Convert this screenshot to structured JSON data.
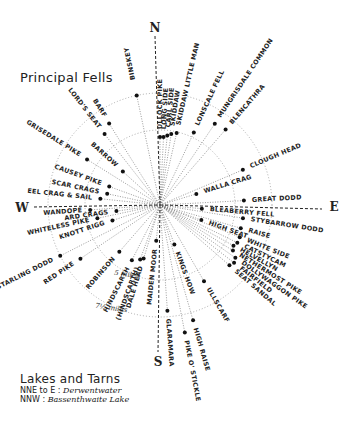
{
  "title": "Principal Fells",
  "compass": {
    "n": "N",
    "e": "E",
    "s": "S",
    "w": "W"
  },
  "center": {
    "x": 160,
    "y": 205
  },
  "rings": [
    {
      "label": "5 miles",
      "r": 75
    },
    {
      "label": "7½ miles",
      "r": 112
    }
  ],
  "fells": [
    {
      "name": "BINSKEY",
      "angle": -12,
      "dot": 112,
      "label": 128
    },
    {
      "name": "ULLOCK PIKE",
      "angle": 0,
      "dot": 68,
      "label": 76
    },
    {
      "name": "LONG SIDE",
      "angle": 3,
      "dot": 68,
      "label": 76
    },
    {
      "name": "CARL SIDE",
      "angle": 6,
      "dot": 70,
      "label": 78
    },
    {
      "name": "SKIDDAW",
      "angle": 9,
      "dot": 72,
      "label": 80
    },
    {
      "name": "SKIDDAW LITTLE MAN",
      "angle": 13,
      "dot": 74,
      "label": 82
    },
    {
      "name": "LONSCALE FELL",
      "angle": 25,
      "dot": 80,
      "label": 88
    },
    {
      "name": "MUNGRISDALE COMMON",
      "angle": 34,
      "dot": 98,
      "label": 106
    },
    {
      "name": "BLENCATHRA",
      "angle": 41,
      "dot": 100,
      "label": 108
    },
    {
      "name": "CLOUGH HEAD",
      "angle": 67,
      "dot": 90,
      "label": 98
    },
    {
      "name": "WALLA CRAG",
      "angle": 73,
      "dot": 38,
      "label": 46
    },
    {
      "name": "GREAT DODD",
      "angle": 87,
      "dot": 84,
      "label": 92
    },
    {
      "name": "BLEABERRY FELL",
      "angle": 95,
      "dot": 42,
      "label": 50
    },
    {
      "name": "STYBARROW DODD",
      "angle": 99,
      "dot": 84,
      "label": 92
    },
    {
      "name": "RAISE",
      "angle": 106,
      "dot": 84,
      "label": 92
    },
    {
      "name": "HIGH SEAT",
      "angle": 110,
      "dot": 44,
      "label": 52
    },
    {
      "name": "WHITE SIDE",
      "angle": 112,
      "dot": 86,
      "label": 94
    },
    {
      "name": "CATSTYCAM",
      "angle": 116,
      "dot": 86,
      "label": 94
    },
    {
      "name": "HELVELLYN",
      "angle": 119,
      "dot": 84,
      "label": 92
    },
    {
      "name": "NETHERMOST PIKE",
      "angle": 122,
      "dot": 86,
      "label": 94
    },
    {
      "name": "DOLLYWAGGON PIKE",
      "angle": 125,
      "dot": 92,
      "label": 100
    },
    {
      "name": "FAIRFIELD",
      "angle": 128,
      "dot": 94,
      "label": 102
    },
    {
      "name": "SEAT SANDAL",
      "angle": 131,
      "dot": 92,
      "label": 100
    },
    {
      "name": "ULLSCARF",
      "angle": 150,
      "dot": 88,
      "label": 96
    },
    {
      "name": "KINGS HOW",
      "angle": 160,
      "dot": 42,
      "label": 50
    },
    {
      "name": "HIGH RAISE",
      "angle": 164,
      "dot": 120,
      "label": 128
    },
    {
      "name": "PIKE O' STICKLE",
      "angle": 169,
      "dot": 130,
      "label": 138
    },
    {
      "name": "GLARAMARA",
      "angle": 176,
      "dot": 106,
      "label": 114
    },
    {
      "name": "MAIDEN MOOR",
      "angle": 186,
      "dot": 36,
      "label": 44
    },
    {
      "name": "DALE HEAD",
      "angle": 197,
      "dot": 56,
      "label": 64
    },
    {
      "name": "(HINDSCARTH)",
      "angle": 200,
      "dot": 58,
      "label": 66
    },
    {
      "name": "HINDSCARTH",
      "angle": 207,
      "dot": 62,
      "label": 70
    },
    {
      "name": "ROBINSON",
      "angle": 221,
      "dot": 62,
      "label": 70
    },
    {
      "name": "RED PIKE",
      "angle": 236,
      "dot": 96,
      "label": 104
    },
    {
      "name": "STARLING DODD",
      "angle": 243,
      "dot": 112,
      "label": 120
    },
    {
      "name": "KNOTT RIGG",
      "angle": 252,
      "dot": 50,
      "label": 58
    },
    {
      "name": "WHITELESS PIKE",
      "angle": 258,
      "dot": 64,
      "label": 72
    },
    {
      "name": "ARD CRAGS",
      "angle": 262,
      "dot": 44,
      "label": 52
    },
    {
      "name": "WANDOPE",
      "angle": 266,
      "dot": 70,
      "label": 78
    },
    {
      "name": "EEL CRAG & SAIL",
      "angle": 276,
      "dot": 60,
      "label": 68
    },
    {
      "name": "SCAR CRAGS",
      "angle": 282,
      "dot": 54,
      "label": 62
    },
    {
      "name": "CAUSEY PIKE",
      "angle": 290,
      "dot": 54,
      "label": 62
    },
    {
      "name": "GRISEDALE PIKE",
      "angle": 302,
      "dot": 86,
      "label": 94
    },
    {
      "name": "BARROW",
      "angle": 312,
      "dot": 50,
      "label": 58
    },
    {
      "name": "LORD'S SEAT",
      "angle": 322,
      "dot": 90,
      "label": 98
    },
    {
      "name": "BARF",
      "angle": 328,
      "dot": 96,
      "label": 104
    }
  ],
  "lakes": {
    "heading": "Lakes and Tarns",
    "items": [
      {
        "direction": "NNE to E :",
        "name": "Derwentwater"
      },
      {
        "direction": "NNW :",
        "name": "Bassenthwaite Lake"
      }
    ]
  }
}
